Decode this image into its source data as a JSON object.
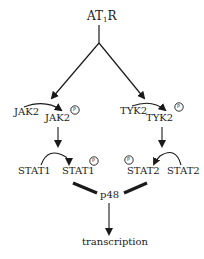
{
  "diagram": {
    "receptor": {
      "main": "AT",
      "sub": "1",
      "suffix": "R"
    },
    "left_branch": {
      "kinase_inactive": "JAK2",
      "kinase_active": "JAK2",
      "stat_inactive": "STAT1",
      "stat_active": "STAT1",
      "phospho_label": "P"
    },
    "right_branch": {
      "kinase_inactive": "TYK2",
      "kinase_active": "TYK2",
      "stat_inactive": "STAT2",
      "stat_active": "STAT2",
      "phospho_label": "P"
    },
    "complex_partner": "p48",
    "outcome": "transcription"
  }
}
